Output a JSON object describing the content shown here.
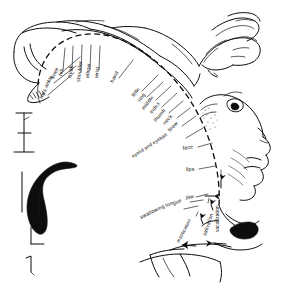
{
  "figure": {
    "name": "motor-homunculus",
    "background_color": "#ffffff",
    "ink_color": "#0d0d0d",
    "width": 281,
    "height": 292
  },
  "chart_data": {
    "type": "diagram",
    "xlabel": "",
    "ylabel": "",
    "grid": false,
    "legend": "none",
    "categories": [
      "toes",
      "ankle",
      "knee",
      "hip",
      "trunk",
      "shoulder",
      "elbow",
      "wrist",
      "hand",
      "little",
      "ring",
      "middle",
      "index",
      "thumb",
      "neck",
      "brow",
      "eyelid and eyeball",
      "face",
      "lips",
      "jaw",
      "tongue",
      "swallowing",
      "mastication",
      "salivation",
      "vocalization"
    ],
    "series": [
      {
        "name": "cortical order medial-to-lateral",
        "values": [
          1,
          2,
          3,
          4,
          5,
          6,
          7,
          8,
          9,
          10,
          11,
          12,
          13,
          14,
          15,
          16,
          17,
          18,
          19,
          20,
          21,
          22,
          23,
          24,
          25
        ]
      }
    ]
  },
  "labels": {
    "lateral_arc": [
      {
        "id": "toes",
        "text": "toes",
        "x": 42,
        "y": 99,
        "rot": -62,
        "anchor": "start",
        "leader": [
          [
            48,
            95
          ],
          [
            74,
            73
          ]
        ]
      },
      {
        "id": "ankle",
        "text": "ankle",
        "x": 47,
        "y": 88,
        "rot": -62,
        "anchor": "start",
        "leader": [
          [
            54,
            83
          ],
          [
            76,
            66
          ]
        ]
      },
      {
        "id": "knee",
        "text": "knee",
        "x": 54,
        "y": 79,
        "rot": -66,
        "anchor": "start",
        "leader": [
          [
            60,
            74
          ],
          [
            80,
            57
          ]
        ]
      },
      {
        "id": "hip",
        "text": "hip",
        "x": 62,
        "y": 76,
        "rot": -80,
        "anchor": "start",
        "leader": [
          [
            63,
            70
          ],
          [
            65,
            48
          ]
        ]
      },
      {
        "id": "trunk",
        "text": "trunk",
        "x": 71,
        "y": 78,
        "rot": -82,
        "anchor": "start",
        "leader": [
          [
            72,
            71
          ],
          [
            73,
            46
          ]
        ]
      },
      {
        "id": "shoulder",
        "text": "shoulder",
        "x": 80,
        "y": 82,
        "rot": -84,
        "anchor": "start",
        "leader": [
          [
            81,
            72
          ],
          [
            82,
            45
          ]
        ]
      },
      {
        "id": "elbow",
        "text": "elbow",
        "x": 89,
        "y": 78,
        "rot": -84,
        "anchor": "start",
        "leader": [
          [
            90,
            70
          ],
          [
            91,
            45
          ]
        ]
      },
      {
        "id": "wrist",
        "text": "wrist",
        "x": 98,
        "y": 78,
        "rot": -84,
        "anchor": "start",
        "leader": [
          [
            99,
            70
          ],
          [
            100,
            46
          ]
        ]
      },
      {
        "id": "hand",
        "text": "hand",
        "x": 113,
        "y": 83,
        "rot": -62,
        "anchor": "start",
        "leader": [
          [
            119,
            78
          ],
          [
            133,
            60
          ]
        ]
      },
      {
        "id": "little",
        "text": "little",
        "x": 134,
        "y": 97,
        "rot": -52,
        "anchor": "start",
        "leader": [
          [
            142,
            91
          ],
          [
            158,
            75
          ]
        ]
      },
      {
        "id": "ring",
        "text": "ring",
        "x": 140,
        "y": 102,
        "rot": -52,
        "anchor": "start",
        "leader": [
          [
            147,
            97
          ],
          [
            163,
            82
          ]
        ]
      },
      {
        "id": "middle",
        "text": "middle",
        "x": 144,
        "y": 110,
        "rot": -52,
        "anchor": "start",
        "leader": [
          [
            156,
            100
          ],
          [
            171,
            86
          ]
        ]
      },
      {
        "id": "index",
        "text": "index",
        "x": 152,
        "y": 114,
        "rot": -52,
        "anchor": "start",
        "leader": [
          [
            162,
            107
          ],
          [
            177,
            93
          ]
        ]
      },
      {
        "id": "thumb",
        "text": "thumb",
        "x": 156,
        "y": 122,
        "rot": -50,
        "anchor": "start",
        "leader": [
          [
            169,
            113
          ],
          [
            183,
            101
          ]
        ]
      },
      {
        "id": "neck",
        "text": "neck",
        "x": 165,
        "y": 125,
        "rot": -48,
        "anchor": "start",
        "leader": [
          [
            177,
            118
          ],
          [
            190,
            108
          ]
        ]
      },
      {
        "id": "brow",
        "text": "brow",
        "x": 170,
        "y": 132,
        "rot": -46,
        "anchor": "start",
        "leader": [
          [
            182,
            126
          ],
          [
            196,
            116
          ]
        ]
      },
      {
        "id": "eyelid-and-eyeball",
        "text": "eyelid and eyeball",
        "x": 133,
        "y": 158,
        "rot": -33,
        "anchor": "start",
        "leader": [
          [
            186,
            138
          ],
          [
            203,
            128
          ]
        ]
      },
      {
        "id": "face",
        "text": "face",
        "x": 183,
        "y": 150,
        "rot": -10,
        "anchor": "start",
        "leader": [
          [
            198,
            147
          ],
          [
            212,
            143
          ]
        ]
      },
      {
        "id": "lips",
        "text": "lips",
        "x": 186,
        "y": 171,
        "rot": 0,
        "anchor": "start",
        "leader": [
          [
            199,
            169
          ],
          [
            215,
            166
          ]
        ]
      },
      {
        "id": "vocalization",
        "text": "vocalization",
        "x": 219,
        "y": 232,
        "rot": -90,
        "anchor": "start",
        "leader": [
          [
            221,
            176
          ],
          [
            221,
            170
          ]
        ]
      },
      {
        "id": "jaw",
        "text": "jaw",
        "x": 186,
        "y": 199,
        "rot": -8,
        "anchor": "start",
        "leader": [
          [
            196,
            197
          ],
          [
            208,
            194
          ]
        ]
      },
      {
        "id": "tongue",
        "text": "tongue",
        "x": 166,
        "y": 207,
        "rot": -18,
        "anchor": "start",
        "leader": [
          [
            190,
            202
          ],
          [
            203,
            200
          ]
        ]
      },
      {
        "id": "swallowing",
        "text": "swallowing",
        "x": 141,
        "y": 219,
        "rot": -26,
        "anchor": "start",
        "leader": [
          [
            184,
            209
          ],
          [
            198,
            206
          ]
        ]
      },
      {
        "id": "salivation",
        "text": "salivation",
        "x": 206,
        "y": 236,
        "rot": -72,
        "anchor": "start",
        "leader": [
          [
            208,
            203
          ],
          [
            209,
            198
          ]
        ]
      },
      {
        "id": "mastication",
        "text": "mastication",
        "x": 179,
        "y": 243,
        "rot": -62,
        "anchor": "start",
        "leader": [
          [
            196,
            216
          ],
          [
            198,
            212
          ]
        ]
      }
    ]
  },
  "insets": {
    "scale_bar": {
      "name": "scale-bar-upper",
      "description": "vertical bracket tick mark"
    },
    "section": {
      "name": "cortical-section-inset",
      "description": "dark filled hook-shaped cortical cross-section"
    },
    "lower_bracket": {
      "name": "scale-bar-lower",
      "description": "small corner bracket mark"
    },
    "corner_mark": {
      "name": "corner-tick-mark",
      "description": "small hooked tick at lower left"
    }
  },
  "body_parts": {
    "foot": "foot-and-leg-drawing",
    "hand": "hand-and-fingers-drawing",
    "face": "face-profile-drawing",
    "jaw": "open-jaw-drawing",
    "tongue": "tongue-drawing"
  }
}
